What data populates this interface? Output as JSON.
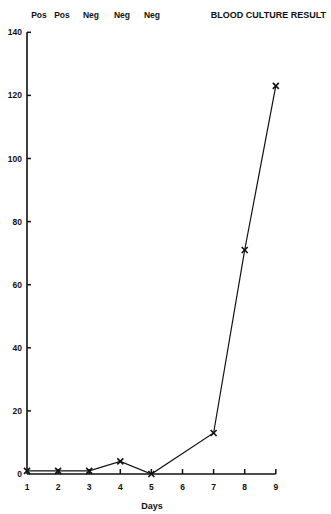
{
  "chart_data": {
    "type": "line",
    "title": "BLOOD CULTURE RESULT",
    "xlabel": "Days",
    "ylabel": "",
    "x_ticks": [
      1,
      2,
      3,
      4,
      5,
      6,
      7,
      8,
      9
    ],
    "y_ticks": [
      0,
      20,
      40,
      60,
      80,
      100,
      120,
      140
    ],
    "ylim": [
      0,
      140
    ],
    "xlim": [
      1,
      9
    ],
    "grid": false,
    "marker": "x",
    "blood_culture_results": [
      {
        "day": 1,
        "result": "Pos"
      },
      {
        "day": 2,
        "result": "Pos"
      },
      {
        "day": 3,
        "result": "Neg"
      },
      {
        "day": 4,
        "result": "Neg"
      },
      {
        "day": 5,
        "result": "Neg"
      }
    ],
    "series": [
      {
        "name": "values",
        "x": [
          1,
          2,
          3,
          4,
          5,
          7,
          8,
          9
        ],
        "values": [
          1,
          1,
          1,
          4,
          0,
          13,
          71,
          123
        ]
      }
    ]
  },
  "layout": {
    "plot_left": 27,
    "plot_bottom": 474,
    "px_per_day": 31.1,
    "px_per_unit": 3.155,
    "line_color": "#111111"
  }
}
